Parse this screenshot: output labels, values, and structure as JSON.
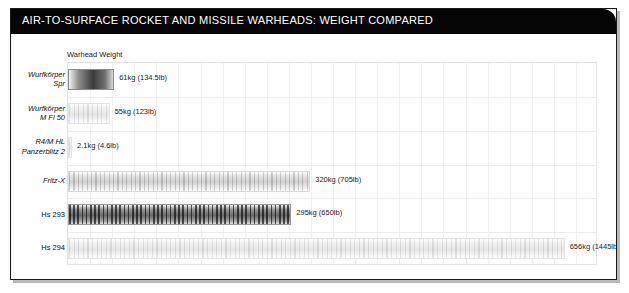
{
  "header": {
    "title": "AIR-TO-SURFACE ROCKET AND MISSILE WARHEADS: WEIGHT COMPARED",
    "bar_color": "#050505",
    "text_color": "#ffffff"
  },
  "chart_data": {
    "type": "bar",
    "orientation": "horizontal",
    "title": "AIR-TO-SURFACE ROCKET AND MISSILE WARHEADS: WEIGHT COMPARED",
    "series_label": "Warhead Weight",
    "xlabel": "",
    "ylabel": "",
    "xlim": [
      0,
      700
    ],
    "grid": true,
    "legend": "none",
    "categories": [
      "Wurfkörper Spr",
      "Wurfkörper M Fl 50",
      "R4/M HL Panzerblitz 2",
      "Fritz-X",
      "Hs 293",
      "Hs 294"
    ],
    "values": [
      61,
      55,
      2.1,
      320,
      295,
      656
    ],
    "units": "kg",
    "value_labels": [
      "61kg (134.5lb)",
      "55kg (123lb)",
      "2.1kg (4.6lb)",
      "320kg (705lb)",
      "295kg (650lb)",
      "656kg (1445lb)"
    ],
    "points": [
      {
        "label": "Wurfkörper Spr",
        "label_line1": "Wurfkörper",
        "label_line2": "Spr",
        "italic": true,
        "kg": 61,
        "lb": 134.5,
        "text": "61kg (134.5lb)",
        "style": "solid"
      },
      {
        "label": "Wurfkörper M Fl 50",
        "label_line1": "Wurfkörper",
        "label_line2": "M Fl 50",
        "italic": true,
        "kg": 55,
        "lb": 123,
        "text": "55kg (123lb)",
        "style": "pale"
      },
      {
        "label": "R4/M HL Panzerblitz 2",
        "label_line1": "R4/M HL",
        "label_line2": "Panzerblitz 2",
        "italic": true,
        "kg": 2.1,
        "lb": 4.6,
        "text": "2.1kg (4.6lb)",
        "style": "pale"
      },
      {
        "label": "Fritz-X",
        "label_line1": "Fritz-X",
        "label_line2": "",
        "italic": true,
        "kg": 320,
        "lb": 705,
        "text": "320kg (705lb)",
        "style": "bar"
      },
      {
        "label": "Hs 293",
        "label_line1": "Hs 293",
        "label_line2": "",
        "italic": false,
        "kg": 295,
        "lb": 650,
        "text": "295kg (650lb)",
        "style": "dense"
      },
      {
        "label": "Hs 294",
        "label_line1": "Hs 294",
        "label_line2": "",
        "italic": false,
        "kg": 656,
        "lb": 1445,
        "text": "656kg (1445lb)",
        "style": "pale"
      }
    ]
  }
}
